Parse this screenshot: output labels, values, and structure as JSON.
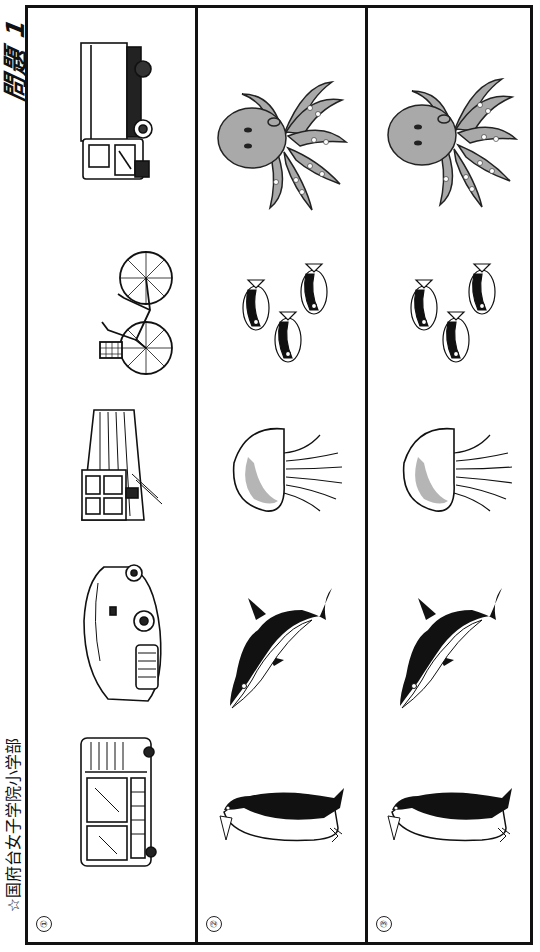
{
  "header": {
    "title": "問題 1",
    "school": "☆国府台女子学院小学部"
  },
  "columns": [
    {
      "label": "①",
      "items": [
        {
          "name": "truck",
          "icon": "truck-icon"
        },
        {
          "name": "bicycle",
          "icon": "bicycle-icon"
        },
        {
          "name": "train",
          "icon": "train-icon"
        },
        {
          "name": "car",
          "icon": "car-icon"
        },
        {
          "name": "bus",
          "icon": "bus-icon"
        }
      ]
    },
    {
      "label": "②",
      "items": [
        {
          "name": "octopus",
          "icon": "octopus-icon"
        },
        {
          "name": "fish",
          "icon": "fish-icon"
        },
        {
          "name": "jellyfish",
          "icon": "jellyfish-icon"
        },
        {
          "name": "dolphin",
          "icon": "dolphin-icon"
        },
        {
          "name": "penguin",
          "icon": "penguin-icon"
        }
      ]
    },
    {
      "label": "③",
      "items": [
        {
          "name": "octopus",
          "icon": "octopus-icon"
        },
        {
          "name": "fish",
          "icon": "fish-icon"
        },
        {
          "name": "jellyfish",
          "icon": "jellyfish-icon"
        },
        {
          "name": "dolphin",
          "icon": "dolphin-icon"
        },
        {
          "name": "penguin",
          "icon": "penguin-icon"
        }
      ]
    }
  ],
  "colors": {
    "line": "#111111",
    "octopus_fill": "#a9a9a9",
    "jellyfish_spot": "#b5b5b5",
    "background": "#ffffff"
  }
}
